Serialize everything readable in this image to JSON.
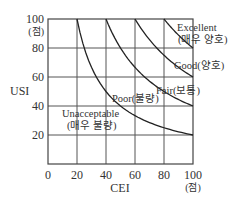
{
  "chart_data": {
    "type": "line",
    "title": "",
    "xlabel": "CEI",
    "ylabel": "USI",
    "xlim": [
      0,
      100
    ],
    "ylim": [
      0,
      100
    ],
    "x_unit_label": "(점)",
    "y_unit_label": "(점)",
    "x_ticks": [
      "0",
      "20",
      "40",
      "60",
      "80",
      "100"
    ],
    "y_ticks": [
      "20",
      "40",
      "60",
      "80",
      "100"
    ],
    "grid": true,
    "legend": "none",
    "series": [
      {
        "name": "boundary-1",
        "relation": "x*y=2000",
        "x": [
          20,
          25,
          30,
          40,
          50,
          60,
          70,
          80,
          90,
          100
        ],
        "y": [
          100,
          80,
          66.7,
          50,
          40,
          33.3,
          28.6,
          25,
          22.2,
          20
        ]
      },
      {
        "name": "boundary-2",
        "relation": "x*y=4000",
        "x": [
          40,
          50,
          60,
          70,
          80,
          90,
          100
        ],
        "y": [
          100,
          80,
          66.7,
          57.1,
          50,
          44.4,
          40
        ]
      },
      {
        "name": "boundary-3",
        "relation": "x*y=6000",
        "x": [
          60,
          70,
          80,
          90,
          100
        ],
        "y": [
          100,
          85.7,
          75,
          66.7,
          60
        ]
      },
      {
        "name": "boundary-4",
        "relation": "x*y=8000",
        "x": [
          80,
          85,
          90,
          95,
          100
        ],
        "y": [
          100,
          94.1,
          88.9,
          84.2,
          80
        ]
      }
    ],
    "region_labels": [
      {
        "line1": "Unacceptable",
        "line2": "(매우 불량)"
      },
      {
        "line1": "Poor(불량)",
        "line2": ""
      },
      {
        "line1": "Fair(보통)",
        "line2": ""
      },
      {
        "line1": "Good(양호)",
        "line2": ""
      },
      {
        "line1": "Excellent",
        "line2": "(매우 양호)"
      }
    ]
  }
}
